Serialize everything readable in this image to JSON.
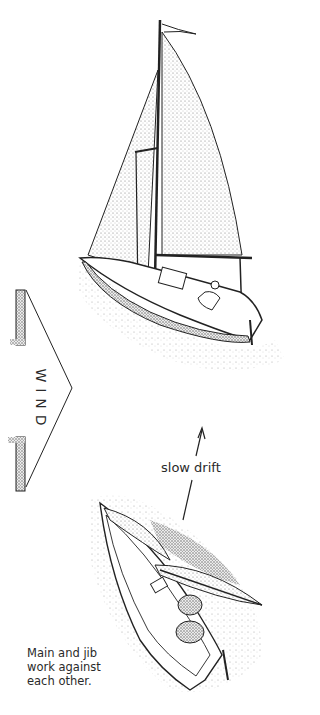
{
  "figure": {
    "wind_label": "WIND",
    "drift_label": "slow drift",
    "caption_lines": [
      "Main and jib",
      "work against",
      "each other."
    ],
    "colors": {
      "ink": "#222222",
      "stipple": "#8a8a8a",
      "background": "#ffffff"
    }
  }
}
